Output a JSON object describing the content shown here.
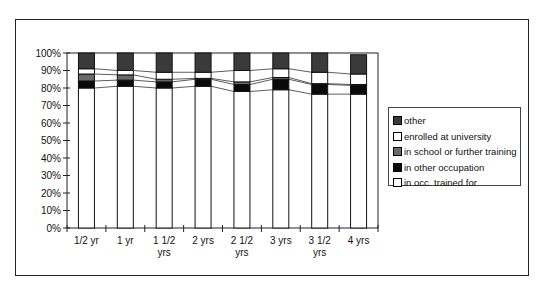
{
  "chart_data": {
    "type": "bar",
    "stacked": true,
    "percent_stacked": true,
    "title": "",
    "xlabel": "",
    "ylabel": "",
    "ylim": [
      0,
      100
    ],
    "yticks": [
      "0%",
      "10%",
      "20%",
      "30%",
      "40%",
      "50%",
      "60%",
      "70%",
      "80%",
      "90%",
      "100%"
    ],
    "categories": [
      [
        "1/2 yr"
      ],
      [
        "1 yr"
      ],
      [
        "1 1/2",
        "yrs"
      ],
      [
        "2 yrs"
      ],
      [
        "2 1/2",
        "yrs"
      ],
      [
        "3 yrs"
      ],
      [
        "3 1/2",
        "yrs"
      ],
      [
        "4 yrs"
      ]
    ],
    "series": [
      {
        "name": "in occ. trained for",
        "color": "#ffffff",
        "values": [
          80,
          81,
          80,
          81,
          78,
          79,
          76.5,
          76.5
        ]
      },
      {
        "name": "in other occupation",
        "color": "#0a0a0a",
        "values": [
          4,
          3.5,
          3.5,
          4,
          4,
          6,
          5.5,
          5
        ]
      },
      {
        "name": "in school or further training",
        "color": "#6a6a6a",
        "values": [
          4,
          3,
          1.5,
          0.5,
          1.5,
          1,
          0.5,
          0.5
        ]
      },
      {
        "name": "enrolled at university",
        "color": "#ffffff",
        "values": [
          3,
          2.5,
          4,
          3.5,
          6.5,
          5,
          6.5,
          6
        ]
      },
      {
        "name": "other",
        "color": "#3a3a3a",
        "values": [
          9,
          10,
          11,
          11,
          10,
          9,
          11,
          11
        ]
      }
    ],
    "grid": false,
    "series_lines": true,
    "legend": {
      "position": "right",
      "order": [
        "other",
        "enrolled at university",
        "in school or further training",
        "in other occupation",
        "in occ. trained for"
      ]
    }
  }
}
